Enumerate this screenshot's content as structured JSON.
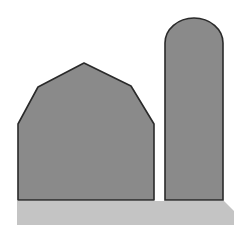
{
  "scene": {
    "description": "Barn and silo silhouette icon",
    "colors": {
      "background": "#ffffff",
      "building_fill": "#8a8a8a",
      "outline": "#2a2a2a",
      "ground": "#c4c4c4"
    },
    "elements": [
      "barn",
      "silo",
      "ground"
    ]
  }
}
